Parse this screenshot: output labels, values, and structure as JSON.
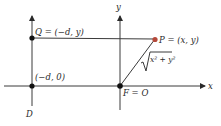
{
  "diagram": {
    "colors": {
      "ink": "#2a2a2a",
      "point_p": "#b5483a",
      "point": "#111111"
    },
    "labels": {
      "q": "Q = (−d, y)",
      "p": "P = (x, y)",
      "neg_d0": "(−d, 0)",
      "f": "F = O",
      "d": "D",
      "x_axis": "x",
      "y_axis": "y",
      "distance": "x² + y²"
    },
    "elements": [
      {
        "id": "directrix",
        "name": "D",
        "kind": "line",
        "equation": "x = -d"
      },
      {
        "id": "x-axis",
        "kind": "axis"
      },
      {
        "id": "y-axis",
        "kind": "axis"
      },
      {
        "id": "Q",
        "kind": "point",
        "coords": "(-d, y)"
      },
      {
        "id": "P",
        "kind": "point",
        "coords": "(x, y)"
      },
      {
        "id": "F",
        "kind": "point",
        "coords": "origin"
      },
      {
        "id": "neg-d-0",
        "kind": "point",
        "coords": "(-d, 0)"
      },
      {
        "id": "segment-QP",
        "kind": "segment",
        "from": "Q",
        "to": "P"
      },
      {
        "id": "segment-FP",
        "kind": "segment",
        "from": "F",
        "to": "P",
        "length": "sqrt(x^2 + y^2)"
      }
    ]
  }
}
